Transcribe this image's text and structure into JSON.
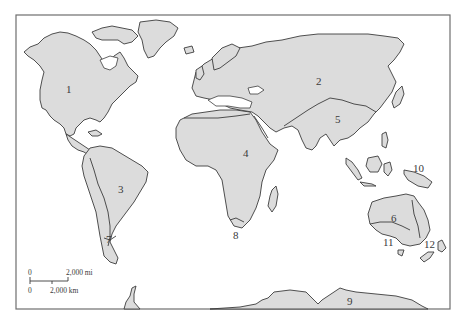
{
  "map": {
    "title": "World biogeographic regions (numbered)",
    "colors": {
      "land": "#dcdcdc",
      "outline": "#3c3c3c",
      "water": "#ffffff",
      "frame": "#6e6e6e"
    },
    "regions": [
      {
        "id": "1",
        "label": "1",
        "location": "North America"
      },
      {
        "id": "2",
        "label": "2",
        "location": "Northern Eurasia"
      },
      {
        "id": "3",
        "label": "3",
        "location": "South America"
      },
      {
        "id": "4",
        "label": "4",
        "location": "Africa"
      },
      {
        "id": "5",
        "label": "5",
        "location": "South Asia"
      },
      {
        "id": "6",
        "label": "6",
        "location": "Australia"
      },
      {
        "id": "7",
        "label": "7",
        "location": "Southern Andes"
      },
      {
        "id": "8",
        "label": "8",
        "location": "Southern tip of Africa"
      },
      {
        "id": "9",
        "label": "9",
        "location": "Antarctica"
      },
      {
        "id": "10",
        "label": "10",
        "location": "New Guinea"
      },
      {
        "id": "11",
        "label": "11",
        "location": "Southwest Australia"
      },
      {
        "id": "12",
        "label": "12",
        "location": "New Zealand"
      }
    ],
    "scale": {
      "mi_start": "0",
      "mi_end": "2,000 mi",
      "km_start": "0",
      "km_end": "2,000 km"
    }
  }
}
